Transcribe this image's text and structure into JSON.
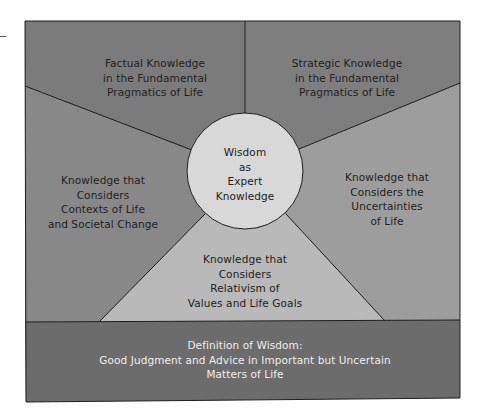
{
  "center": {
    "lines": [
      "Wisdom",
      "as",
      "Expert",
      "Knowledge"
    ]
  },
  "regions": {
    "top_left": {
      "lines": [
        "Factual Knowledge",
        "in the Fundamental",
        "Pragmatics of Life"
      ]
    },
    "top_right": {
      "lines": [
        "Strategic Knowledge",
        "in the Fundamental",
        "Pragmatics of Life"
      ]
    },
    "left": {
      "lines": [
        "Knowledge that",
        "Considers",
        "Contexts of Life",
        "and Societal Change"
      ]
    },
    "right": {
      "lines": [
        "Knowledge that",
        "Considers the",
        "Uncertainties",
        "of Life"
      ]
    },
    "bottom": {
      "lines": [
        "Knowledge that",
        "Considers",
        "Relativism of",
        "Values and Life Goals"
      ]
    }
  },
  "definition": {
    "lines": [
      "Definition of Wisdom:",
      "Good Judgment and Advice in Important but Uncertain",
      "Matters of Life"
    ]
  },
  "colors": {
    "top_regions": "#7b7b7b",
    "left_region": "#888888",
    "right_region": "#9d9d9d",
    "bottom_triangle": "#b9b9b9",
    "center_circle": "#d8d8d8",
    "definition_band": "#6c6c6c",
    "outline": "#1e1e1e"
  }
}
